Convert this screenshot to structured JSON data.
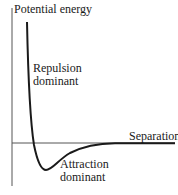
{
  "diagram": {
    "y_axis_label": "Potential energy",
    "x_axis_label": "Separation",
    "annotations": {
      "repulsion": [
        "Repulsion",
        "dominant"
      ],
      "attraction": [
        "Attraction",
        "dominant"
      ]
    },
    "colors": {
      "curve": "#1a1a1a",
      "axes": "#555555",
      "text": "#1a1a1a",
      "background": "#ffffff"
    }
  }
}
